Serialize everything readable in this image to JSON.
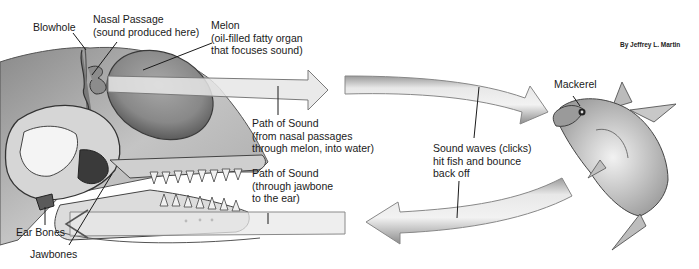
{
  "diagram": {
    "credit": "By Jeffrey L. Martin",
    "labels": {
      "blowhole": "Blowhole",
      "nasal_passage": {
        "line1": "Nasal Passage",
        "line2": "(sound produced here)"
      },
      "melon": {
        "line1": "Melon",
        "line2": "(oil-filled fatty organ",
        "line3": "that focuses sound)"
      },
      "path_out": {
        "line1": "Path of Sound",
        "line2": "(from nasal passages",
        "line3": "through melon, into water)"
      },
      "path_in": {
        "line1": "Path of Sound",
        "line2": "(through jawbone",
        "line3": "to the ear)"
      },
      "sound_waves": {
        "line1": "Sound waves (clicks)",
        "line2": "hit fish and bounce",
        "line3": "back off"
      },
      "mackerel": "Mackerel",
      "ear_bones": "Ear Bones",
      "jawbones": "Jawbones"
    },
    "nodes": [
      "Blowhole",
      "Nasal Passage",
      "Melon",
      "Ear Bones",
      "Jawbones",
      "Mackerel"
    ],
    "edges": [
      {
        "from": "Nasal Passage",
        "to": "Melon",
        "label": "Path of Sound (outgoing)"
      },
      {
        "from": "Melon",
        "to": "Mackerel",
        "label": "Sound waves (clicks)"
      },
      {
        "from": "Mackerel",
        "to": "Jawbones",
        "label": "Echo returns"
      },
      {
        "from": "Jawbones",
        "to": "Ear Bones",
        "label": "Path of Sound (through jawbone to the ear)"
      }
    ],
    "colors": {
      "ink": "#1a1a1a",
      "arrow_fill": "#e4e4e4",
      "arrow_edge": "#8a8a8a",
      "head_shade": "#9c9c9c",
      "melon": "#8e8e8e"
    }
  }
}
